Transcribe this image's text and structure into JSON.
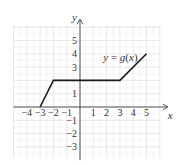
{
  "chart_data": {
    "type": "line",
    "title": "",
    "xlabel": "x",
    "ylabel": "y",
    "xlim": [
      -5,
      6
    ],
    "ylim": [
      -4,
      6
    ],
    "grid": true,
    "x_ticks": [
      "-4",
      "-3",
      "-2",
      "-1",
      "1",
      "2",
      "3",
      "4",
      "5"
    ],
    "y_ticks": [
      "5",
      "4",
      "3",
      "1",
      "-1",
      "-2",
      "-3"
    ],
    "series": [
      {
        "name": "y = g(x)",
        "points": [
          [
            -3,
            0
          ],
          [
            -2,
            2
          ],
          [
            3,
            2
          ],
          [
            5,
            4
          ]
        ]
      }
    ],
    "annotations": [
      {
        "text": "y = g(x)",
        "x": 2.5,
        "y": 3.5
      }
    ],
    "colors": {
      "line": "#1a1a1a",
      "grid": "#d6d6d6",
      "axis": "#444444"
    }
  },
  "labels": {
    "x_axis": "x",
    "y_axis": "y",
    "function": "y = g(x)"
  }
}
